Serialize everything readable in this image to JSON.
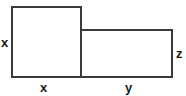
{
  "diagram": {
    "type": "area-model",
    "colors": {
      "stroke": "#3a3a3a",
      "text": "#1a1a1a",
      "background": "#ffffff"
    },
    "shapes": [
      {
        "name": "square",
        "side_labels": {
          "left": "x",
          "bottom": "x"
        }
      },
      {
        "name": "rectangle",
        "side_labels": {
          "right": "z",
          "bottom": "y"
        }
      }
    ],
    "labels": {
      "square_left": "x",
      "square_bottom": "x",
      "rect_bottom": "y",
      "rect_right": "z"
    }
  }
}
